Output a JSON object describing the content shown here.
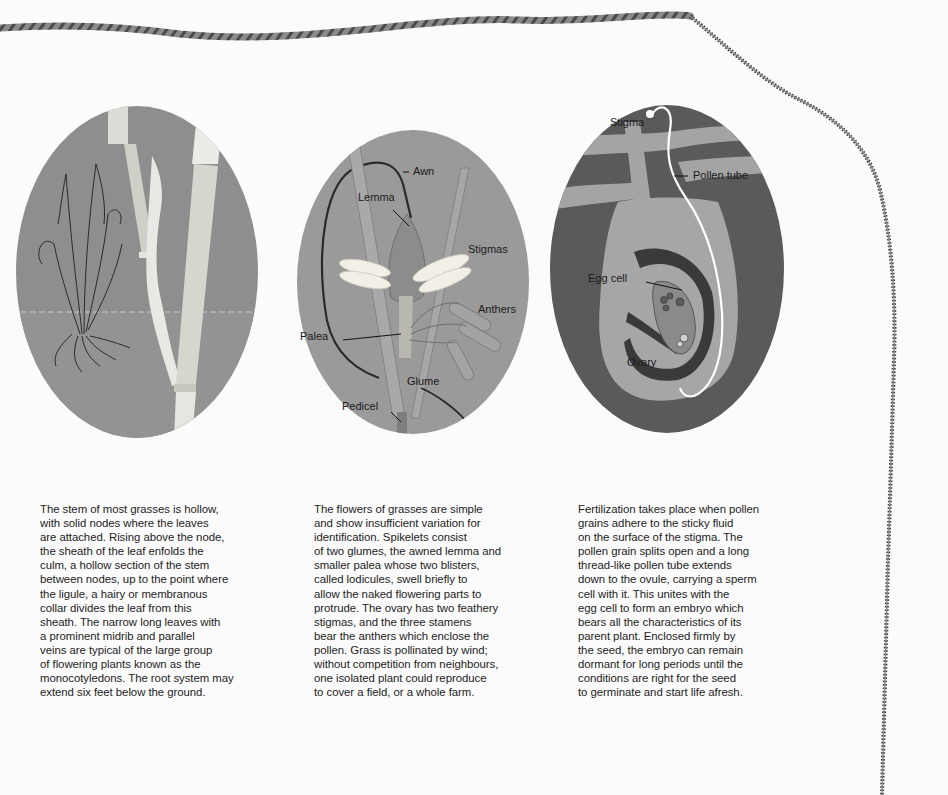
{
  "page": {
    "background": "#fbfbfb",
    "rope_color": "#6f6f6f"
  },
  "plates": [
    {
      "id": "stem",
      "subject": "grass stem, sheath, node and whole plant with roots",
      "labels": []
    },
    {
      "id": "flower",
      "subject": "grass spikelet / flower",
      "labels": {
        "awn": "Awn",
        "lemma": "Lemma",
        "stigmas": "Stigmas",
        "anthers": "Anthers",
        "palea": "Palea",
        "glume": "Glume",
        "pedicel": "Pedicel"
      }
    },
    {
      "id": "fertilization",
      "subject": "ovary cross-section with pollen tube",
      "labels": {
        "stigma": "Stigma",
        "pollen_tube": "Pollen tube",
        "egg_cell": "Egg cell",
        "ovary": "Ovary"
      }
    }
  ],
  "columns": [
    {
      "lines": [
        "The stem of most grasses is hollow,",
        "with solid nodes where the leaves",
        "are attached. Rising above the node,",
        "the sheath of the leaf enfolds the",
        "culm, a hollow section of the stem",
        "between nodes, up to the point where",
        "the ligule, a hairy or membranous",
        "collar divides the leaf from this",
        "sheath. The narrow long leaves with",
        "a prominent midrib and parallel",
        "veins are typical of the large group",
        "of flowering plants known as the",
        "monocotyledons. The root system may",
        "extend six feet below the ground."
      ]
    },
    {
      "lines": [
        "The flowers of grasses are simple",
        "and show insufficient variation for",
        "identification. Spikelets consist",
        "of two glumes, the awned lemma and",
        "smaller palea whose two blisters,",
        "called lodicules, swell briefly to",
        "allow the naked flowering parts to",
        "protrude. The ovary has two feathery",
        "stigmas, and the three stamens",
        "bear the anthers which enclose the",
        "pollen. Grass is pollinated by wind;",
        "without competition from neighbours,",
        "one isolated plant could reproduce",
        "to cover a field, or a whole farm."
      ]
    },
    {
      "lines": [
        "Fertilization takes place when pollen",
        "grains adhere to the sticky fluid",
        "on the surface of the stigma. The",
        "pollen grain splits open and a long",
        "thread-like pollen tube extends",
        "down to the ovule, carrying a sperm",
        "cell with it. This unites with the",
        "egg cell to form an embryo which",
        "bears all the characteristics of its",
        "parent plant. Enclosed firmly by",
        "the seed, the embryo can remain",
        "dormant for long periods until the",
        "conditions are right for the seed",
        "to germinate and start life afresh."
      ]
    }
  ]
}
